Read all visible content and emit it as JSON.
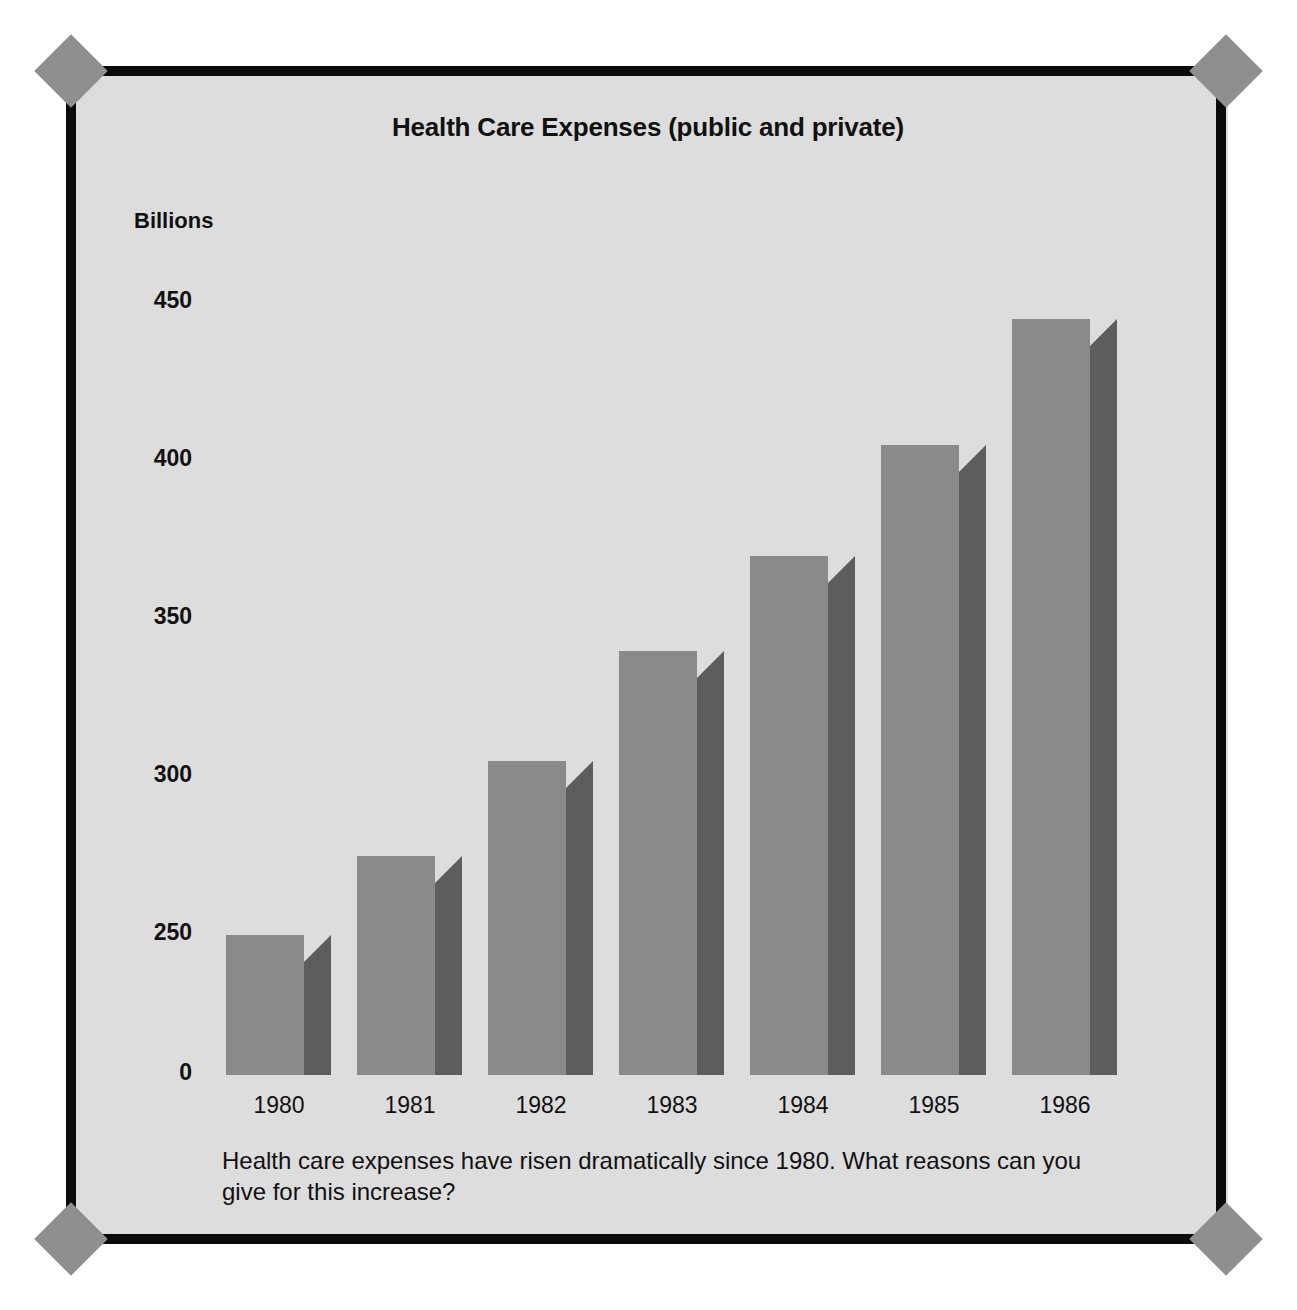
{
  "figure": {
    "title": "Health Care Expenses (public and private)",
    "caption": "Health care expenses have risen dramatically since 1980. What reasons can you give for this increase?",
    "unit_label": "Billions",
    "background_color": "#dddddd",
    "frame_color": "#0b0b0b",
    "diamond_color": "#8f8f8f",
    "bar_face_color": "#8a8a8a",
    "bar_side_color": "#5d5d5d"
  },
  "chart_data": {
    "type": "bar",
    "title": "Health Care Expenses (public and private)",
    "xlabel": "",
    "ylabel": "Billions",
    "categories": [
      "1980",
      "1981",
      "1982",
      "1983",
      "1984",
      "1985",
      "1986"
    ],
    "values": [
      250,
      275,
      305,
      340,
      370,
      405,
      445
    ],
    "ytick_labels": [
      "450",
      "400",
      "350",
      "300",
      "250",
      "0"
    ],
    "ytick_values": [
      450,
      400,
      350,
      300,
      250,
      0
    ],
    "ylim": [
      0,
      470
    ],
    "axis_note": "broken/compressed axis between 0 and 250",
    "grid": false,
    "legend": null,
    "style": "3d-shaded-bars"
  }
}
